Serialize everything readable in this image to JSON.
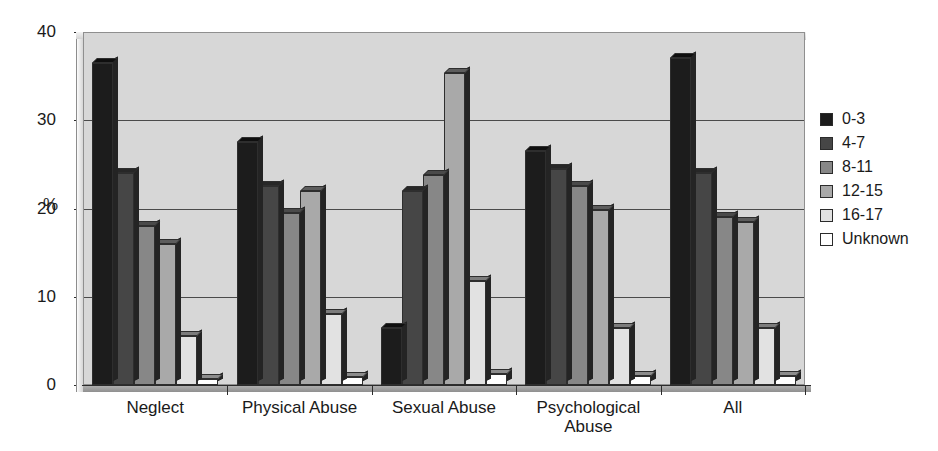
{
  "chart_data": {
    "type": "bar",
    "title": "",
    "subtitle": "",
    "xlabel": "",
    "ylabel": "%",
    "ylim": [
      0,
      40
    ],
    "yticks": [
      0,
      10,
      20,
      30,
      40
    ],
    "grid": "horizontal",
    "legend_position": "right",
    "orientation": "vertical",
    "grouping": "clustered",
    "categories": [
      "Neglect",
      "Physical Abuse",
      "Sexual Abuse",
      "Psychological Abuse",
      "All"
    ],
    "category_lines": [
      [
        "Neglect"
      ],
      [
        "Physical Abuse"
      ],
      [
        "Sexual Abuse"
      ],
      [
        "Psychological",
        "Abuse"
      ],
      [
        "All"
      ]
    ],
    "series": [
      {
        "name": "0-3",
        "color": "#1c1c1c",
        "values": [
          36.5,
          27.5,
          6.5,
          26.5,
          37.0
        ]
      },
      {
        "name": "4-7",
        "color": "#464646",
        "values": [
          24.0,
          22.5,
          22.0,
          24.5,
          24.0
        ]
      },
      {
        "name": "8-11",
        "color": "#878787",
        "values": [
          18.0,
          19.5,
          23.8,
          22.5,
          19.0
        ]
      },
      {
        "name": "12-15",
        "color": "#a9a9a9",
        "values": [
          16.0,
          22.0,
          35.3,
          19.8,
          18.5
        ]
      },
      {
        "name": "16-17",
        "color": "#e2e2e2",
        "values": [
          5.6,
          8.0,
          11.8,
          6.5,
          6.5
        ]
      },
      {
        "name": "Unknown",
        "color": "#ffffff",
        "values": [
          0.7,
          0.9,
          1.3,
          1.0,
          1.0
        ]
      }
    ]
  },
  "axis": {
    "y_title": "%",
    "y_tick_labels": [
      "40",
      "30",
      "20",
      "10",
      "0"
    ]
  },
  "legend": {
    "items": [
      {
        "label": "0-3",
        "color": "#1c1c1c"
      },
      {
        "label": "4-7",
        "color": "#464646"
      },
      {
        "label": "8-11",
        "color": "#878787"
      },
      {
        "label": "12-15",
        "color": "#a9a9a9"
      },
      {
        "label": "16-17",
        "color": "#e2e2e2"
      },
      {
        "label": "Unknown",
        "color": "#ffffff"
      }
    ]
  },
  "style": {
    "plot_background": "#d7d7d7",
    "gridline_color": "#4a4a4a",
    "axis_color": "#2b2b2b",
    "page_background": "#ffffff"
  }
}
